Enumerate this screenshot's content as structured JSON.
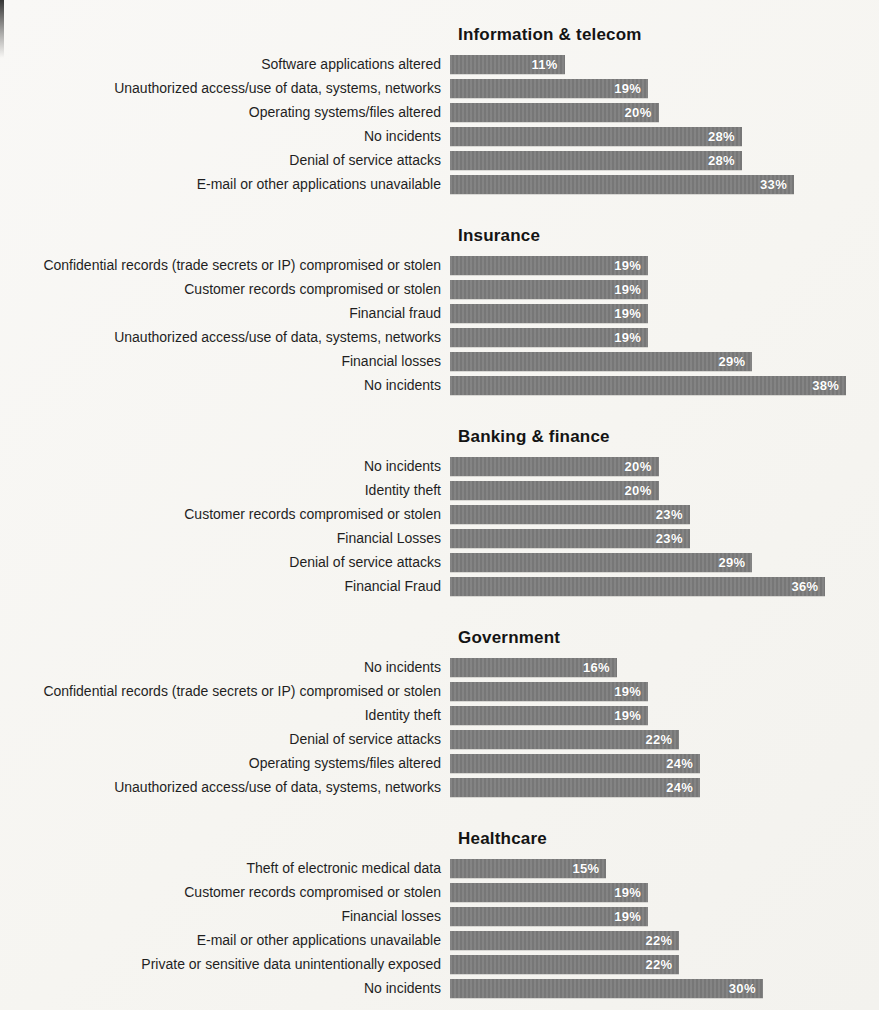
{
  "page": {
    "background": "#f6f5f1",
    "bar_color": "#7d7d7d",
    "value_label_color": "#ffffff",
    "category_label_color": "#1f1f1f",
    "title_color": "#141414",
    "value_unit": "%"
  },
  "chart_data": [
    {
      "type": "bar",
      "orientation": "horizontal",
      "title": "Information & telecom",
      "categories": [
        "Software applications altered",
        "Unauthorized access/use of data, systems, networks",
        "Operating systems/files altered",
        "No incidents",
        "Denial of service attacks",
        "E-mail or other applications unavailable"
      ],
      "values": [
        11,
        19,
        20,
        28,
        28,
        33
      ],
      "xlabel": "",
      "ylabel": "",
      "xlim": [
        0,
        40
      ],
      "grid": false,
      "legend": false,
      "value_labels": [
        "11%",
        "19%",
        "20%",
        "28%",
        "28%",
        "33%"
      ]
    },
    {
      "type": "bar",
      "orientation": "horizontal",
      "title": "Insurance",
      "categories": [
        "Confidential records (trade secrets or IP) compromised or stolen",
        "Customer records compromised or stolen",
        "Financial fraud",
        "Unauthorized access/use of data, systems, networks",
        "Financial losses",
        "No incidents"
      ],
      "values": [
        19,
        19,
        19,
        19,
        29,
        38
      ],
      "xlabel": "",
      "ylabel": "",
      "xlim": [
        0,
        40
      ],
      "grid": false,
      "legend": false,
      "value_labels": [
        "19%",
        "19%",
        "19%",
        "19%",
        "29%",
        "38%"
      ]
    },
    {
      "type": "bar",
      "orientation": "horizontal",
      "title": "Banking & finance",
      "categories": [
        "No incidents",
        "Identity theft",
        "Customer records compromised or stolen",
        "Financial Losses",
        "Denial of service attacks",
        "Financial Fraud"
      ],
      "values": [
        20,
        20,
        23,
        23,
        29,
        36
      ],
      "xlabel": "",
      "ylabel": "",
      "xlim": [
        0,
        40
      ],
      "grid": false,
      "legend": false,
      "value_labels": [
        "20%",
        "20%",
        "23%",
        "23%",
        "29%",
        "36%"
      ]
    },
    {
      "type": "bar",
      "orientation": "horizontal",
      "title": "Government",
      "categories": [
        "No incidents",
        "Confidential records (trade secrets or IP) compromised or stolen",
        "Identity theft",
        "Denial of service attacks",
        "Operating systems/files altered",
        "Unauthorized access/use of data, systems, networks"
      ],
      "values": [
        16,
        19,
        19,
        22,
        24,
        24
      ],
      "xlabel": "",
      "ylabel": "",
      "xlim": [
        0,
        40
      ],
      "grid": false,
      "legend": false,
      "value_labels": [
        "16%",
        "19%",
        "19%",
        "22%",
        "24%",
        "24%"
      ]
    },
    {
      "type": "bar",
      "orientation": "horizontal",
      "title": "Healthcare",
      "categories": [
        "Theft of electronic medical data",
        "Customer records compromised or stolen",
        "Financial losses",
        "E-mail or other applications unavailable",
        "Private or sensitive data unintentionally exposed",
        "No incidents"
      ],
      "values": [
        15,
        19,
        19,
        22,
        22,
        30
      ],
      "xlabel": "",
      "ylabel": "",
      "xlim": [
        0,
        40
      ],
      "grid": false,
      "legend": false,
      "value_labels": [
        "15%",
        "19%",
        "19%",
        "22%",
        "22%",
        "30%"
      ]
    }
  ]
}
